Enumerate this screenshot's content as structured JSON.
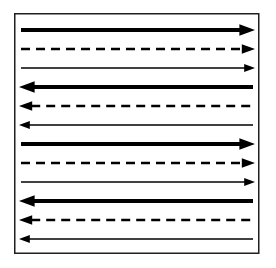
{
  "diagram": {
    "background_color": "#ffffff",
    "border_color": "#1f1f1f",
    "arrow_color": "#000000",
    "styles": {
      "thick-solid": {
        "stroke_width": 3.8,
        "dash": null
      },
      "dashed": {
        "stroke_width": 2.6,
        "dash": "9,6"
      },
      "thin-solid": {
        "stroke_width": 1.4,
        "dash": null
      }
    },
    "rows": [
      {
        "index": 1,
        "direction": "right",
        "style": "thick-solid"
      },
      {
        "index": 2,
        "direction": "right",
        "style": "dashed"
      },
      {
        "index": 3,
        "direction": "right",
        "style": "thin-solid"
      },
      {
        "index": 4,
        "direction": "left",
        "style": "thick-solid"
      },
      {
        "index": 5,
        "direction": "left",
        "style": "dashed"
      },
      {
        "index": 6,
        "direction": "left",
        "style": "thin-solid"
      },
      {
        "index": 7,
        "direction": "right",
        "style": "thick-solid"
      },
      {
        "index": 8,
        "direction": "right",
        "style": "dashed"
      },
      {
        "index": 9,
        "direction": "right",
        "style": "thin-solid"
      },
      {
        "index": 10,
        "direction": "left",
        "style": "thick-solid"
      },
      {
        "index": 11,
        "direction": "left",
        "style": "dashed"
      },
      {
        "index": 12,
        "direction": "left",
        "style": "thin-solid"
      }
    ]
  }
}
